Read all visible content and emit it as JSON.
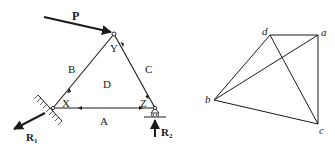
{
  "truss": {
    "joints": {
      "X": {
        "label": "X",
        "x": 53,
        "y": 108
      },
      "Y": {
        "label": "Y",
        "x": 114,
        "y": 34
      },
      "Z": {
        "label": "Z",
        "x": 155,
        "y": 108
      }
    },
    "region_labels": {
      "A": "A",
      "B": "B",
      "C": "C",
      "D": "D"
    },
    "loads": {
      "P": {
        "label": "P"
      },
      "R1": {
        "label": "R",
        "subscript": "1"
      },
      "R2": {
        "label": "R",
        "subscript": "2"
      }
    }
  },
  "force_diagram": {
    "points": {
      "a": {
        "label": "a",
        "x": 318,
        "y": 35
      },
      "b": {
        "label": "b",
        "x": 214,
        "y": 100
      },
      "c": {
        "label": "c",
        "x": 318,
        "y": 124
      },
      "d": {
        "label": "d",
        "x": 270,
        "y": 35
      }
    },
    "segments": [
      [
        "d",
        "a"
      ],
      [
        "a",
        "c"
      ],
      [
        "c",
        "b"
      ],
      [
        "b",
        "d"
      ],
      [
        "b",
        "a"
      ],
      [
        "d",
        "c"
      ]
    ]
  },
  "colors": {
    "stroke": "#1a1a1a",
    "background": "#ffffff"
  }
}
